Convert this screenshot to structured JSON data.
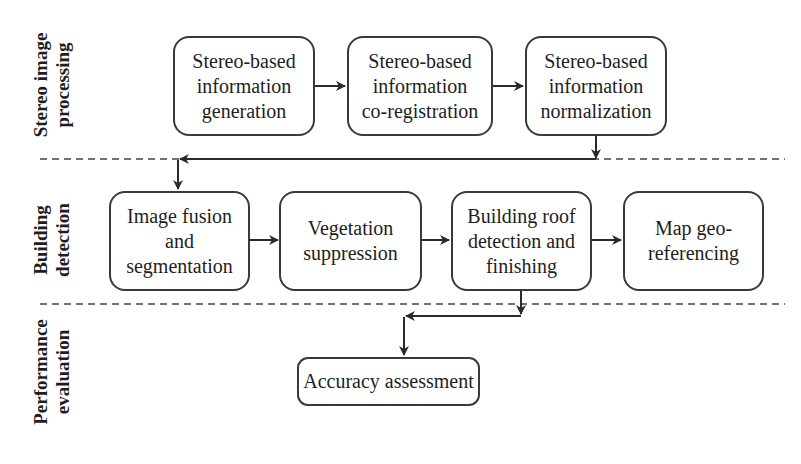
{
  "lanes": [
    {
      "label": "Stereo image\nprocessing"
    },
    {
      "label": "Building\ndetection"
    },
    {
      "label": "Performance\nevaluation"
    }
  ],
  "stereo": {
    "generation": "Stereo-based\ninformation\ngeneration",
    "coregistration": "Stereo-based\ninformation\nco-registration",
    "normalization": "Stereo-based\ninformation\nnormalization"
  },
  "building": {
    "fusion": "Image fusion\nand\nsegmentation",
    "vegetation": "Vegetation\nsuppression",
    "roof": "Building roof\ndetection and\nfinishing",
    "georef": "Map geo-\nreferencing"
  },
  "performance": {
    "accuracy": "Accuracy assessment"
  },
  "colors": {
    "stroke": "#3a3a3a",
    "text": "#1e1e1e",
    "background": "#ffffff"
  }
}
